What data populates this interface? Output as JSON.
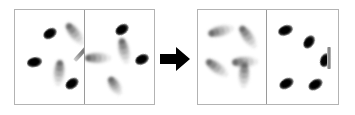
{
  "figure": {
    "title": "",
    "type": "visual-search-display-transformation",
    "arrow_icon": "right-arrow-icon",
    "colors": {
      "frame": "#b3b3b3",
      "divider": "#9a9a9a",
      "sharp_item": "#000000",
      "blurred_item": "#8f8f8f",
      "target_bar": "#8d8d8d",
      "arrow": "#000000",
      "background": "#ffffff"
    },
    "panels": [
      {
        "id": "before",
        "label": "",
        "left_panel": {
          "label": "",
          "items": [
            {
              "x": 28,
              "y": 18,
              "w": 16,
              "h": 11,
              "rot": -28,
              "blur": "sharp"
            },
            {
              "x": 47,
              "y": 19,
              "w": 26,
              "h": 10,
              "rot": 52,
              "blur": "blurred"
            },
            {
              "x": 12,
              "y": 47,
              "w": 17,
              "h": 11,
              "rot": -8,
              "blur": "sharp"
            },
            {
              "x": 31,
              "y": 58,
              "w": 26,
              "h": 10,
              "rot": 95,
              "blur": "blurred"
            },
            {
              "x": 50,
              "y": 68,
              "w": 16,
              "h": 11,
              "rot": -32,
              "blur": "sharp"
            }
          ],
          "target": {
            "x": 56,
            "y": 40,
            "w": 23,
            "h": 4,
            "rot": -48
          }
        },
        "right_panel": {
          "label": "",
          "items": [
            {
              "x": 31,
              "y": 14,
              "w": 16,
              "h": 11,
              "rot": -30,
              "blur": "sharp"
            },
            {
              "x": 1,
              "y": 43,
              "w": 26,
              "h": 10,
              "rot": 0,
              "blur": "blurred"
            },
            {
              "x": 27,
              "y": 36,
              "w": 26,
              "h": 10,
              "rot": 78,
              "blur": "blurred"
            },
            {
              "x": 51,
              "y": 44,
              "w": 16,
              "h": 11,
              "rot": -22,
              "blur": "sharp"
            },
            {
              "x": 21,
              "y": 71,
              "w": 20,
              "h": 10,
              "rot": 58,
              "blur": "blurred"
            }
          ],
          "target": null
        }
      },
      {
        "id": "after",
        "label": "",
        "left_panel": {
          "label": "",
          "items": [
            {
              "x": 10,
              "y": 16,
              "w": 26,
              "h": 10,
              "rot": -14,
              "blur": "blurred"
            },
            {
              "x": 37,
              "y": 22,
              "w": 26,
              "h": 10,
              "rot": 55,
              "blur": "blurred"
            },
            {
              "x": 6,
              "y": 53,
              "w": 26,
              "h": 10,
              "rot": 36,
              "blur": "blurred"
            },
            {
              "x": 34,
              "y": 47,
              "w": 26,
              "h": 10,
              "rot": -2,
              "blur": "blurred"
            },
            {
              "x": 33,
              "y": 60,
              "w": 26,
              "h": 10,
              "rot": 92,
              "blur": "blurred"
            }
          ],
          "target": null
        },
        "right_panel": {
          "label": "",
          "items": [
            {
              "x": 12,
              "y": 15,
              "w": 17,
              "h": 11,
              "rot": -18,
              "blur": "sharp"
            },
            {
              "x": 36,
              "y": 26,
              "w": 16,
              "h": 11,
              "rot": -52,
              "blur": "sharp"
            },
            {
              "x": 52,
              "y": 44,
              "w": 16,
              "h": 11,
              "rot": -64,
              "blur": "sharp"
            },
            {
              "x": 13,
              "y": 68,
              "w": 17,
              "h": 11,
              "rot": -26,
              "blur": "sharp"
            },
            {
              "x": 42,
              "y": 69,
              "w": 17,
              "h": 11,
              "rot": -28,
              "blur": "sharp"
            }
          ],
          "target": {
            "x": 61,
            "y": 37,
            "w": 4,
            "h": 22,
            "rot": 0
          }
        }
      }
    ]
  }
}
